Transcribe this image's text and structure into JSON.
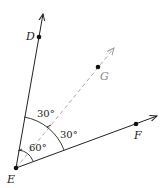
{
  "diagram": {
    "points": [
      {
        "name": "D",
        "x": 39,
        "y": 37
      },
      {
        "name": "E",
        "x": 16,
        "y": 168
      },
      {
        "name": "F",
        "x": 136,
        "y": 124
      },
      {
        "name": "G",
        "x": 98,
        "y": 67
      }
    ],
    "rays": [
      {
        "name": "ray-ED",
        "from": "E",
        "through": "D",
        "style": "solid"
      },
      {
        "name": "ray-EF",
        "from": "E",
        "through": "F",
        "style": "solid"
      },
      {
        "name": "ray-EG",
        "from": "E",
        "through": "G",
        "style": "dashed"
      }
    ],
    "angles": {
      "DEG": "30°",
      "GEF": "30°",
      "DEF": "60°"
    },
    "labels": {
      "D": "D",
      "E": "E",
      "F": "F",
      "G": "G"
    },
    "colors": {
      "solid": "#222222",
      "dashed": "#aaaaaa"
    }
  }
}
